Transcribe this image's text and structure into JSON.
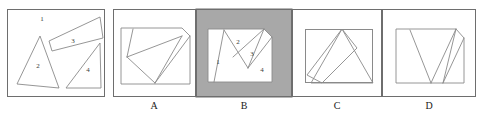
{
  "figure": {
    "background_color": "#ffffff",
    "line_color": "#8a8a8a",
    "frame_color": "#6e6e6e",
    "shaded_panel_color": "#a8a8a8",
    "label_color": "#1a1a1a"
  },
  "prompt_panel": {
    "name": "prompt",
    "label": "",
    "pieces": [
      {
        "id": "1",
        "label": "1",
        "label_x": 42,
        "label_y": 19,
        "shape": "empty-space-region",
        "points": ""
      },
      {
        "id": "2",
        "label": "2",
        "label_x": 38,
        "label_y": 66,
        "shape": "triangle",
        "points": "40,36 17,84 59,88"
      },
      {
        "id": "3",
        "label": "3",
        "label_x": 73,
        "label_y": 41,
        "shape": "thin-quadrilateral",
        "points": "100,17 103,38 52,51 49,41"
      },
      {
        "id": "4",
        "label": "4",
        "label_x": 88,
        "label_y": 70,
        "shape": "right-triangle",
        "points": "100,43 101,88 66,88"
      }
    ]
  },
  "options": [
    {
      "key": "A",
      "label": "A",
      "shaded": false,
      "panel_x": 113,
      "inner_box": "121,28 190,28 190,84 121,84",
      "pieces": [
        {
          "shape": "outer-with-cut-corner",
          "points": "121,28 182,28 190,36 190,84 121,84"
        },
        {
          "shape": "line",
          "points": "133,29 127,57"
        },
        {
          "shape": "line",
          "points": "127,57 182,36"
        },
        {
          "shape": "line",
          "points": "182,36 155,83"
        },
        {
          "shape": "line",
          "points": "155,83 127,57"
        },
        {
          "shape": "line",
          "points": "190,36 155,83"
        }
      ],
      "numbers": []
    },
    {
      "key": "B",
      "label": "B",
      "shaded": true,
      "panel_x": 196,
      "shade_rect": "196,9 292,9 292,97 196,97",
      "inner_box": "208,29 272,29 272,82 208,82",
      "pieces": [
        {
          "shape": "outer-with-cut-corner",
          "points": "208,29 264,29 272,37 272,82 208,82"
        },
        {
          "shape": "line",
          "points": "224,30 214,82"
        },
        {
          "shape": "line",
          "points": "224,30 248,68"
        },
        {
          "shape": "line",
          "points": "248,68 264,29"
        },
        {
          "shape": "line",
          "points": "233,57 264,29"
        },
        {
          "shape": "line",
          "points": "248,68 272,37"
        }
      ],
      "numbers": [
        {
          "label": "1",
          "x": 218,
          "y": 62
        },
        {
          "label": "2",
          "x": 238,
          "y": 42
        },
        {
          "label": "3",
          "x": 252,
          "y": 54
        },
        {
          "label": "4",
          "x": 262,
          "y": 70
        }
      ]
    },
    {
      "key": "C",
      "label": "C",
      "shaded": false,
      "panel_x": 296,
      "inner_box": "305,29 373,29 373,83 305,83",
      "pieces": [
        {
          "shape": "triangle",
          "points": "342,29 373,83 311,83"
        },
        {
          "shape": "parallelogram",
          "points": "342,29 357,48 322,83 307,75"
        }
      ],
      "numbers": []
    },
    {
      "key": "D",
      "label": "D",
      "shaded": false,
      "panel_x": 386,
      "inner_box": "396,29 464,29 464,83 396,83",
      "pieces": [
        {
          "shape": "outer-with-cut-corner",
          "points": "396,29 456,29 464,38 464,83 396,83"
        },
        {
          "shape": "line",
          "points": "410,30 431,83"
        },
        {
          "shape": "line",
          "points": "431,83 456,29"
        },
        {
          "shape": "line",
          "points": "456,29 464,38"
        },
        {
          "shape": "line",
          "points": "464,38 443,83"
        },
        {
          "shape": "line",
          "points": "443,83 456,29"
        }
      ],
      "numbers": []
    }
  ],
  "panel_frames": [
    {
      "name": "prompt-frame",
      "rect": "7,9 105,97"
    },
    {
      "name": "option-a-frame",
      "rect": "113,9 196,97"
    },
    {
      "name": "option-b-frame",
      "rect": "196,9 292,97"
    },
    {
      "name": "option-c-frame",
      "rect": "292,9 382,97"
    },
    {
      "name": "option-d-frame",
      "rect": "382,9 476,97"
    }
  ],
  "option_label_positions": [
    {
      "key": "A",
      "x": 154,
      "y": 107
    },
    {
      "key": "B",
      "x": 244,
      "y": 107
    },
    {
      "key": "C",
      "x": 337,
      "y": 107
    },
    {
      "key": "D",
      "x": 429,
      "y": 107
    }
  ]
}
